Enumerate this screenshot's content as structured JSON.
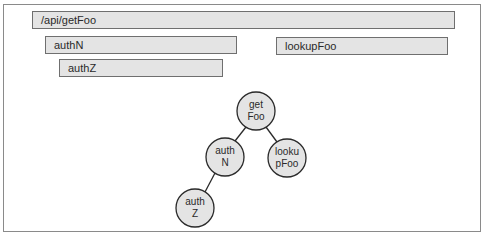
{
  "spans": [
    {
      "id": "getFoo",
      "label": "/api/getFoo",
      "x": 32,
      "y": 11,
      "w": 423,
      "h": 18
    },
    {
      "id": "authN",
      "label": "authN",
      "x": 45,
      "y": 36,
      "w": 192,
      "h": 18
    },
    {
      "id": "authZ",
      "label": "authZ",
      "x": 59,
      "y": 59,
      "w": 164,
      "h": 18
    },
    {
      "id": "lookupFoo",
      "label": "lookupFoo",
      "x": 276,
      "y": 37,
      "w": 172,
      "h": 18
    }
  ],
  "tree": {
    "nodes": [
      {
        "id": "getFoo",
        "line1": "get",
        "line2": "Foo",
        "cx": 256,
        "cy": 111
      },
      {
        "id": "authN",
        "line1": "auth",
        "line2": "N",
        "cx": 225,
        "cy": 157
      },
      {
        "id": "lookupFoo",
        "line1": "looku",
        "line2": "pFoo",
        "cx": 287,
        "cy": 158
      },
      {
        "id": "authZ",
        "line1": "auth",
        "line2": "Z",
        "cx": 195,
        "cy": 208
      }
    ],
    "edges": [
      {
        "from": "getFoo",
        "to": "authN"
      },
      {
        "from": "getFoo",
        "to": "lookupFoo"
      },
      {
        "from": "authN",
        "to": "authZ"
      }
    ],
    "radius": 19
  },
  "colors": {
    "box_fill": "#e4e4e4",
    "box_border": "#6f6f6f",
    "text": "#2a2a2a",
    "frame_border": "#8a8a8a"
  }
}
